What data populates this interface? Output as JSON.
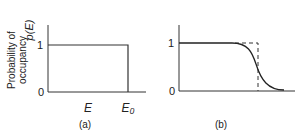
{
  "y_axis_label": {
    "line1": "Probability of",
    "line2": "occupancy",
    "symbol": "p(E)"
  },
  "panel_a": {
    "caption": "(a)",
    "tick_one": "1",
    "tick_zero": "0",
    "x_label": "E",
    "x_marker": "E₀"
  },
  "panel_b": {
    "caption": "(b)",
    "tick_one": "1",
    "tick_zero": "0"
  }
}
